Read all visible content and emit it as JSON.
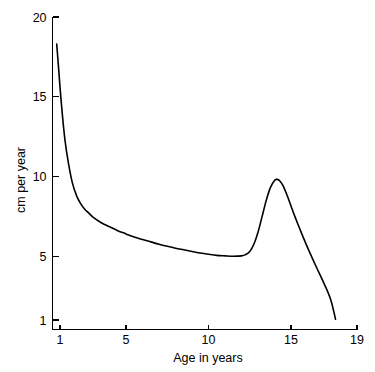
{
  "chart_data": {
    "type": "line",
    "title": "",
    "subtitle": "",
    "xlabel": "Age in years",
    "ylabel": "cm per year",
    "xlim": [
      0.55,
      19
    ],
    "ylim": [
      0.4,
      20
    ],
    "grid": false,
    "legend": null,
    "xticks": [
      1,
      5,
      10,
      15,
      19
    ],
    "xticklabels": [
      "1",
      "5",
      "10",
      "15",
      "19"
    ],
    "yticks": [
      1,
      5,
      10,
      15,
      20
    ],
    "yticklabels": [
      "1",
      "5",
      "10",
      "15",
      "20"
    ],
    "series": [
      {
        "name": "Growth velocity",
        "color": "#000000",
        "x": [
          0.8,
          0.9,
          1.0,
          1.15,
          1.3,
          1.5,
          1.75,
          2.0,
          2.25,
          2.5,
          2.75,
          3.0,
          3.5,
          4.0,
          4.5,
          5.0,
          5.5,
          6.0,
          6.5,
          7.0,
          7.5,
          8.0,
          8.5,
          9.0,
          9.5,
          10.0,
          10.5,
          11.0,
          11.5,
          12.0,
          12.25,
          12.5,
          12.75,
          13.0,
          13.25,
          13.5,
          13.75,
          14.0,
          14.15,
          14.3,
          14.5,
          14.75,
          15.0,
          15.25,
          15.5,
          16.0,
          16.5,
          17.0,
          17.4,
          17.7
        ],
        "y": [
          18.3,
          17.0,
          15.6,
          13.8,
          12.3,
          10.9,
          9.6,
          8.8,
          8.3,
          7.95,
          7.7,
          7.45,
          7.1,
          6.85,
          6.6,
          6.4,
          6.2,
          6.05,
          5.9,
          5.75,
          5.62,
          5.5,
          5.4,
          5.3,
          5.2,
          5.12,
          5.05,
          5.02,
          5.0,
          5.02,
          5.1,
          5.3,
          5.75,
          6.5,
          7.5,
          8.5,
          9.3,
          9.75,
          9.82,
          9.75,
          9.45,
          8.85,
          8.15,
          7.45,
          6.8,
          5.55,
          4.4,
          3.3,
          2.3,
          1.05
        ]
      }
    ],
    "annotations": {
      "infancy_start_value": 18.3,
      "childhood_trough_value": 5.0,
      "childhood_trough_age": 11.5,
      "pubertal_peak_value": 9.8,
      "pubertal_peak_age": 14.1,
      "end_value": 1.0,
      "end_age": 17.7
    }
  }
}
